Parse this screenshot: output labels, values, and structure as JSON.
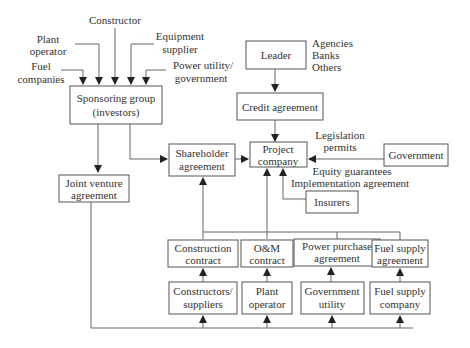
{
  "diagram": {
    "inputs_to_sponsor": {
      "constructor": "Constructor",
      "plant_operator": [
        "Plant",
        "operator"
      ],
      "equipment_supplier": [
        "Equipment",
        "supplier"
      ],
      "fuel_companies": [
        "Fuel",
        "companies"
      ],
      "power_utility": [
        "Power utility/",
        "government"
      ]
    },
    "sponsoring_group": [
      "Sponsoring group",
      "(investors)"
    ],
    "leader": "Leader",
    "lenders": [
      "Agencies",
      "Banks",
      "Others"
    ],
    "credit_agreement": "Credit agreement",
    "shareholder_agreement": [
      "Shareholder",
      "agreement"
    ],
    "project_company": [
      "Project",
      "company"
    ],
    "government": "Government",
    "government_label_above": [
      "Legislation",
      "permits"
    ],
    "government_label_below": [
      "Equity guarantees",
      "Implementation agreement"
    ],
    "insurers": "Insurers",
    "joint_venture": [
      "Joint venture",
      "agreement"
    ],
    "contracts": [
      {
        "label": [
          "Construction",
          "contract"
        ]
      },
      {
        "label": [
          "O&M",
          "contract"
        ]
      },
      {
        "label": [
          "Power purchase",
          "agreement"
        ]
      },
      {
        "label": [
          "Fuel supply",
          "agreement"
        ]
      }
    ],
    "parties": [
      {
        "label": [
          "Constructors/",
          "suppliers"
        ]
      },
      {
        "label": [
          "Plant",
          "operator"
        ]
      },
      {
        "label": [
          "Government",
          "utility"
        ]
      },
      {
        "label": [
          "Fuel supply",
          "company"
        ]
      }
    ]
  }
}
